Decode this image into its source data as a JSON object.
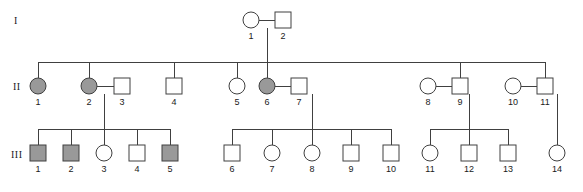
{
  "figure": {
    "type": "pedigree-chart",
    "width": 583,
    "height": 192,
    "background": "#ffffff",
    "line_color": "#404040",
    "symbol_stroke": "#404040",
    "affected_fill": "#999999",
    "unaffected_fill": "#ffffff"
  },
  "generation_labels": [
    {
      "text": "I",
      "x": 14,
      "y": 22
    },
    {
      "text": "II",
      "x": 13,
      "y": 88
    },
    {
      "text": "III",
      "x": 11,
      "y": 156
    }
  ],
  "legend_meaning": {
    "filled": "affected",
    "open": "unaffected",
    "circle": "female",
    "square": "male"
  },
  "generations": [
    {
      "name": "I",
      "y_center": 20,
      "individuals": [
        {
          "id": "1",
          "shape": "circle",
          "sex": "female",
          "status": "unaffected",
          "x": 251,
          "y": 20
        },
        {
          "id": "2",
          "shape": "square",
          "sex": "male",
          "status": "unaffected",
          "x": 283,
          "y": 20
        }
      ]
    },
    {
      "name": "II",
      "y_center": 86,
      "individuals": [
        {
          "id": "1",
          "shape": "circle",
          "sex": "female",
          "status": "affected",
          "x": 38,
          "y": 86
        },
        {
          "id": "2",
          "shape": "circle",
          "sex": "female",
          "status": "affected",
          "x": 89,
          "y": 86
        },
        {
          "id": "3",
          "shape": "square",
          "sex": "male",
          "status": "unaffected",
          "x": 122,
          "y": 86
        },
        {
          "id": "4",
          "shape": "square",
          "sex": "male",
          "status": "unaffected",
          "x": 174,
          "y": 86
        },
        {
          "id": "5",
          "shape": "circle",
          "sex": "female",
          "status": "unaffected",
          "x": 237,
          "y": 86
        },
        {
          "id": "6",
          "shape": "circle",
          "sex": "female",
          "status": "affected",
          "x": 267,
          "y": 86
        },
        {
          "id": "7",
          "shape": "square",
          "sex": "male",
          "status": "unaffected",
          "x": 299,
          "y": 86
        },
        {
          "id": "8",
          "shape": "circle",
          "sex": "female",
          "status": "unaffected",
          "x": 428,
          "y": 86
        },
        {
          "id": "9",
          "shape": "square",
          "sex": "male",
          "status": "unaffected",
          "x": 460,
          "y": 86
        },
        {
          "id": "10",
          "shape": "circle",
          "sex": "female",
          "status": "unaffected",
          "x": 513,
          "y": 86
        },
        {
          "id": "11",
          "shape": "square",
          "sex": "male",
          "status": "unaffected",
          "x": 545,
          "y": 86
        }
      ]
    },
    {
      "name": "III",
      "y_center": 153,
      "individuals": [
        {
          "id": "1",
          "shape": "square",
          "sex": "male",
          "status": "affected",
          "x": 38,
          "y": 153
        },
        {
          "id": "2",
          "shape": "square",
          "sex": "male",
          "status": "affected",
          "x": 71,
          "y": 153
        },
        {
          "id": "3",
          "shape": "circle",
          "sex": "female",
          "status": "unaffected",
          "x": 104,
          "y": 153
        },
        {
          "id": "4",
          "shape": "square",
          "sex": "male",
          "status": "unaffected",
          "x": 137,
          "y": 153
        },
        {
          "id": "5",
          "shape": "square",
          "sex": "male",
          "status": "affected",
          "x": 170,
          "y": 153
        },
        {
          "id": "6",
          "shape": "square",
          "sex": "male",
          "status": "unaffected",
          "x": 232,
          "y": 153
        },
        {
          "id": "7",
          "shape": "circle",
          "sex": "female",
          "status": "unaffected",
          "x": 272,
          "y": 153
        },
        {
          "id": "8",
          "shape": "circle",
          "sex": "female",
          "status": "unaffected",
          "x": 312,
          "y": 153
        },
        {
          "id": "9",
          "shape": "square",
          "sex": "male",
          "status": "unaffected",
          "x": 351,
          "y": 153
        },
        {
          "id": "10",
          "shape": "square",
          "sex": "male",
          "status": "unaffected",
          "x": 391,
          "y": 153
        },
        {
          "id": "11",
          "shape": "circle",
          "sex": "female",
          "status": "unaffected",
          "x": 430,
          "y": 153
        },
        {
          "id": "12",
          "shape": "square",
          "sex": "male",
          "status": "unaffected",
          "x": 469,
          "y": 153
        },
        {
          "id": "13",
          "shape": "square",
          "sex": "male",
          "status": "unaffected",
          "x": 508,
          "y": 153
        },
        {
          "id": "14",
          "shape": "circle",
          "sex": "female",
          "status": "unaffected",
          "x": 557,
          "y": 153
        }
      ]
    }
  ],
  "matings": [
    {
      "name": "I-1 x I-2",
      "x1": 259,
      "x2": 275,
      "y": 20
    },
    {
      "name": "II-2 x II-3",
      "x1": 97,
      "x2": 114,
      "y": 86
    },
    {
      "name": "II-6 x II-7",
      "x1": 275,
      "x2": 291,
      "y": 86
    },
    {
      "name": "II-8 x II-9",
      "x1": 436,
      "x2": 452,
      "y": 86
    },
    {
      "name": "II-10 x II-11",
      "x1": 521,
      "x2": 537,
      "y": 86
    }
  ],
  "sibships": [
    {
      "name": "generation-II-sibship",
      "descent_from_x": 267,
      "descent_from_y": 28,
      "bar_y": 62,
      "bar_x1": 38,
      "bar_x2": 545,
      "child_x": [
        38,
        89,
        174,
        237,
        267,
        460,
        545
      ],
      "child_top_y": 78
    },
    {
      "name": "generation-III-sibship-a",
      "descent_from_x": 104,
      "descent_from_y": 94,
      "bar_y": 129,
      "bar_x1": 38,
      "bar_x2": 170,
      "child_x": [
        38,
        71,
        104,
        137,
        170
      ],
      "child_top_y": 145
    },
    {
      "name": "generation-III-sibship-b",
      "descent_from_x": 312,
      "descent_from_y": 94,
      "bar_y": 129,
      "bar_x1": 232,
      "bar_x2": 391,
      "child_x": [
        232,
        272,
        312,
        351,
        391
      ],
      "child_top_y": 145
    },
    {
      "name": "generation-III-sibship-c",
      "descent_from_x": 469,
      "descent_from_y": 94,
      "bar_y": 129,
      "bar_x1": 430,
      "bar_x2": 508,
      "child_x": [
        430,
        469,
        508
      ],
      "child_top_y": 145
    },
    {
      "name": "generation-III-sibship-d",
      "descent_from_x": 557,
      "descent_from_y": 94,
      "bar_y": 129,
      "bar_x1": 557,
      "bar_x2": 557,
      "child_x": [
        557
      ],
      "child_top_y": 145
    }
  ],
  "symbol_size": {
    "circle_radius": 8,
    "square_side": 16
  },
  "id_label_offset_y": 16
}
